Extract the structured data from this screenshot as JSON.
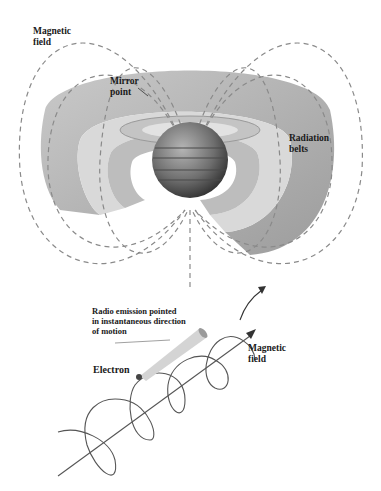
{
  "top_diagram": {
    "title": "Jupiter magnetosphere and radiation belts",
    "labels": {
      "magnetic_field": "Magnetic\nfield",
      "mirror_point": "Mirror\npoint",
      "radiation_belts": "Radiation\nbelts"
    }
  },
  "bottom_diagram": {
    "title": "Electron spiraling along magnetic field",
    "labels": {
      "radio_emission": "Radio emission pointed\nin instantaneous direction\nof motion",
      "electron": "Electron",
      "magnetic_field": "Magnetic\nfield"
    }
  },
  "colors": {
    "belt_outer": "#a8a8a8",
    "belt_inner": "#cfcfcf",
    "field_line": "#8a8a8a",
    "planet": "#6a6a6a",
    "text": "#1a1a1a"
  }
}
